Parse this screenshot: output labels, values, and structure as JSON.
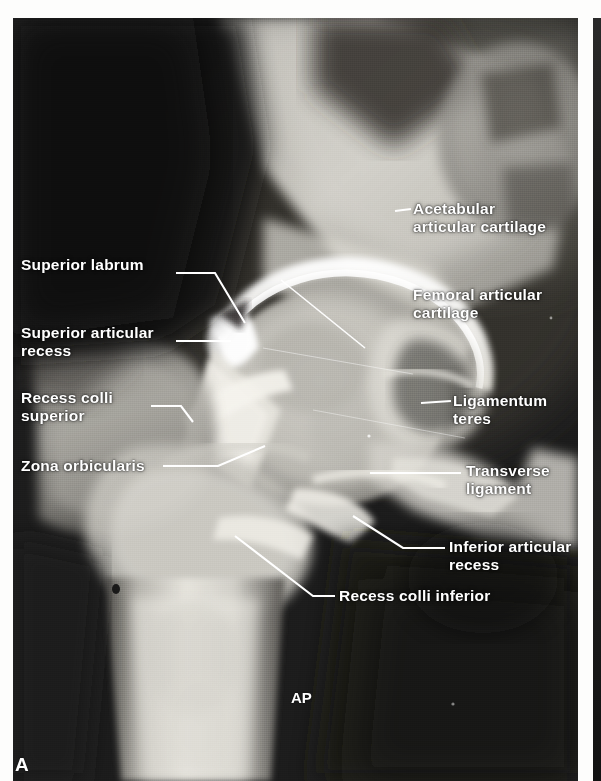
{
  "figure": {
    "panel_letter": "A",
    "view_tag": "AP",
    "modality": "hip arthrogram radiograph"
  },
  "labels": {
    "left": [
      {
        "id": "superior-labrum",
        "text": "Superior labrum"
      },
      {
        "id": "superior-articular-recess",
        "text": "Superior articular\nrecess"
      },
      {
        "id": "recess-colli-superior",
        "text": "Recess colli\nsuperior"
      },
      {
        "id": "zona-orbicularis",
        "text": "Zona orbicularis"
      }
    ],
    "right": [
      {
        "id": "acetabular-articular-cartilage",
        "text": "Acetabular\narticular cartilage"
      },
      {
        "id": "femoral-articular-cartilage",
        "text": "Femoral articular\ncartilage"
      },
      {
        "id": "ligamentum-teres",
        "text": "Ligamentum\nteres"
      },
      {
        "id": "transverse-ligament",
        "text": "Transverse\nligament"
      },
      {
        "id": "inferior-articular-recess",
        "text": "Inferior articular\nrecess"
      },
      {
        "id": "recess-colli-inferior",
        "text": "Recess colli inferior"
      }
    ]
  },
  "colors": {
    "label_text": "#ffffff",
    "leader_line": "#ffffff",
    "page_background": "#fdfdfc",
    "film_dark": "#1b1b1b",
    "contrast_bright": "#f2f2ee"
  }
}
